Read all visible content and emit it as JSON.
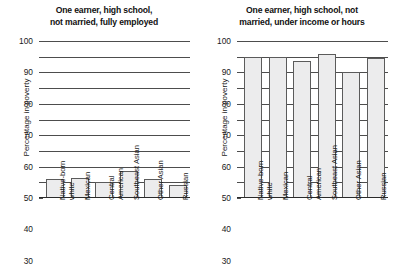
{
  "figure": {
    "ylabel": "Percentage in poverty",
    "yticks": [
      0,
      10,
      20,
      30,
      40,
      50,
      60,
      70,
      80,
      90,
      100
    ],
    "categories": [
      {
        "line1": "Native-born",
        "line2": "white"
      },
      {
        "line1": "Mexican",
        "line2": ""
      },
      {
        "line1": "Central",
        "line2": "American"
      },
      {
        "line1": "Southeast Asian",
        "line2": ""
      },
      {
        "line1": "Other Asian",
        "line2": ""
      },
      {
        "line1": "Russian",
        "line2": ""
      }
    ],
    "panels": [
      {
        "title_line1": "One earner, high school,",
        "title_line2": "not married, fully employed"
      },
      {
        "title_line1": "One earner, high school, not",
        "title_line2": "married, under income or hours"
      }
    ]
  },
  "chart_data": [
    {
      "type": "bar",
      "title": "One earner, high school, not married, fully employed",
      "xlabel": "",
      "ylabel": "Percentage in poverty",
      "ylim": [
        0,
        100
      ],
      "yticks": [
        0,
        10,
        20,
        30,
        40,
        50,
        60,
        70,
        80,
        90,
        100
      ],
      "grid": "horizontal",
      "legend": "none",
      "categories": [
        "Native-born white",
        "Mexican",
        "Central American",
        "Southeast Asian",
        "Other Asian",
        "Russian"
      ],
      "values": [
        12,
        13,
        10.5,
        17,
        12,
        8.5
      ]
    },
    {
      "type": "bar",
      "title": "One earner, high school, not married, under income or hours",
      "xlabel": "",
      "ylabel": "Percentage in poverty",
      "ylim": [
        0,
        100
      ],
      "yticks": [
        0,
        10,
        20,
        30,
        40,
        50,
        60,
        70,
        80,
        90,
        100
      ],
      "grid": "horizontal",
      "legend": "none",
      "categories": [
        "Native-born white",
        "Mexican",
        "Central American",
        "Southeast Asian",
        "Other Asian",
        "Russian"
      ],
      "values": [
        90,
        90,
        87,
        92,
        80,
        89
      ]
    }
  ]
}
